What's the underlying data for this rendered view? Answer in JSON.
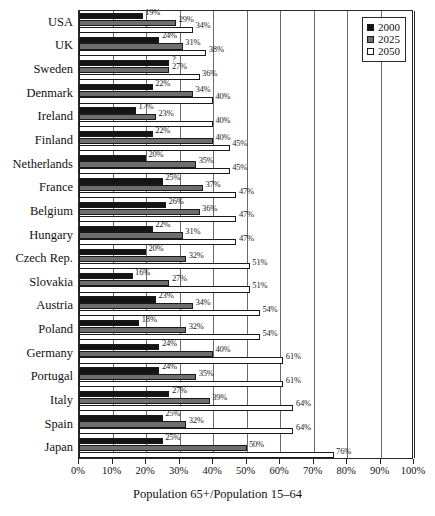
{
  "chart_data": {
    "type": "bar",
    "orientation": "horizontal",
    "title": "",
    "xlabel": "Population 65+/Population 15–64",
    "ylabel": "",
    "xlim": [
      0,
      100
    ],
    "xtick_labels": [
      "0%",
      "10%",
      "20%",
      "30%",
      "40%",
      "50%",
      "60%",
      "70%",
      "80%",
      "90%",
      "100%"
    ],
    "xticks": [
      0,
      10,
      20,
      30,
      40,
      50,
      60,
      70,
      80,
      90,
      100
    ],
    "grid": true,
    "legend_position": "top-right",
    "categories": [
      "USA",
      "UK",
      "Sweden",
      "Denmark",
      "Ireland",
      "Finland",
      "Netherlands",
      "France",
      "Belgium",
      "Hungary",
      "Czech Rep.",
      "Slovakia",
      "Austria",
      "Poland",
      "Germany",
      "Portugal",
      "Italy",
      "Spain",
      "Japan"
    ],
    "series": [
      {
        "name": "2000",
        "color": "#141414",
        "values": [
          19,
          24,
          27,
          22,
          17,
          22,
          20,
          25,
          26,
          22,
          20,
          16,
          23,
          18,
          24,
          24,
          27,
          25,
          25
        ],
        "labels": [
          "19%",
          "24%",
          "?",
          "22%",
          "17%",
          "22%",
          "20%",
          "25%",
          "26%",
          "22%",
          "20%",
          "16%",
          "23%",
          "18%",
          "24%",
          "24%",
          "27%",
          "25%",
          "25%"
        ]
      },
      {
        "name": "2025",
        "color": "#6e6e6e",
        "values": [
          29,
          31,
          27,
          34,
          23,
          40,
          35,
          37,
          36,
          31,
          32,
          27,
          34,
          32,
          40,
          35,
          39,
          32,
          50
        ],
        "labels": [
          "29%",
          "31%",
          "27%",
          "34%",
          "23%",
          "40%",
          "35%",
          "37%",
          "36%",
          "31%",
          "32%",
          "27%",
          "34%",
          "32%",
          "40%",
          "35%",
          "39%",
          "32%",
          "50%"
        ]
      },
      {
        "name": "2050",
        "color": "#ffffff",
        "values": [
          34,
          38,
          36,
          40,
          40,
          45,
          45,
          47,
          47,
          47,
          51,
          51,
          54,
          54,
          61,
          61,
          64,
          64,
          76
        ],
        "labels": [
          "34%",
          "38%",
          "36%",
          "40%",
          "40%",
          "45%",
          "45%",
          "47%",
          "47%",
          "47%",
          "51%",
          "51%",
          "54%",
          "54%",
          "61%",
          "61%",
          "64%",
          "64%",
          "76%"
        ]
      }
    ]
  },
  "legend": {
    "entries": [
      {
        "label": "2000",
        "color": "#141414"
      },
      {
        "label": "2025",
        "color": "#6e6e6e"
      },
      {
        "label": "2050",
        "color": "#ffffff"
      }
    ]
  }
}
